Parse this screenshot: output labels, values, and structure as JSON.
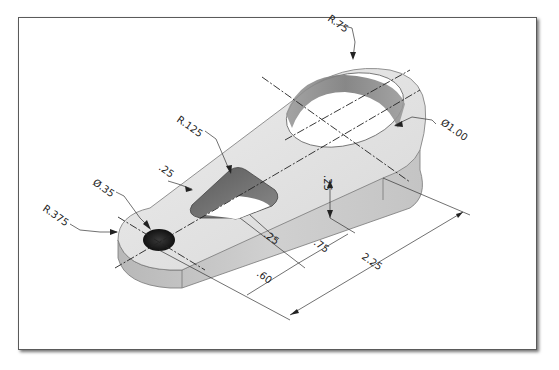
{
  "drawing": {
    "title": "Isometric view of link bracket with dimensions",
    "colors": {
      "frame_border": "#5a5a5a",
      "part_top": "#e4e4e4",
      "part_side": "#c8c8c8",
      "part_side_dark": "#b4b4b4",
      "hole_dark": "#1e1e1e",
      "slot_wall": "#6e6e6e",
      "dim_line": "#333333"
    },
    "dimensions": {
      "large_outer_radius": "R.75",
      "large_hole_diameter": "Ø1.00",
      "slot_radius": "R.125",
      "slot_offset": ".25",
      "small_hole_diameter": "Ø.35",
      "small_end_radius": "R.375",
      "slot_width": ".25",
      "thickness": ".25",
      "slot_length": ".75",
      "slot_start": ".60",
      "center_distance": "2.25"
    }
  }
}
